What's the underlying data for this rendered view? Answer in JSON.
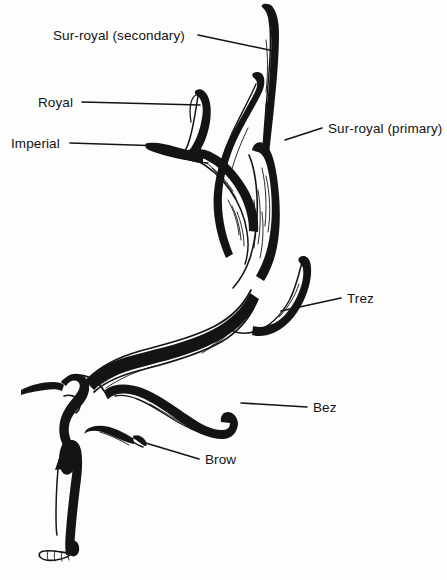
{
  "figure": {
    "background_color": "#fdfdfd",
    "ink_color": "#141414",
    "width": 447,
    "height": 580
  },
  "labels": [
    {
      "id": "sur-royal-secondary",
      "text": "Sur-royal (secondary)",
      "text_x": 53,
      "text_y": 40,
      "anchor": "start",
      "leader": "M 198 35 L 274 51",
      "side": "left"
    },
    {
      "id": "royal",
      "text": "Royal",
      "text_x": 38,
      "text_y": 107,
      "anchor": "start",
      "leader": "M 82 102 L 200 105",
      "side": "left"
    },
    {
      "id": "imperial",
      "text": "Imperial",
      "text_x": 11,
      "text_y": 148,
      "anchor": "start",
      "leader": "M 70 143 L 163 146",
      "side": "left"
    },
    {
      "id": "sur-royal-primary",
      "text": "Sur-royal (primary)",
      "text_x": 328,
      "text_y": 133,
      "anchor": "start",
      "leader": "M 322 128 L 285 140",
      "side": "right"
    },
    {
      "id": "trez",
      "text": "Trez",
      "text_x": 347,
      "text_y": 303,
      "anchor": "start",
      "leader": "M 341 298 L 281 311",
      "side": "right"
    },
    {
      "id": "bez",
      "text": "Bez",
      "text_x": 313,
      "text_y": 412,
      "anchor": "start",
      "leader": "M 307 407 L 241 403",
      "side": "right"
    },
    {
      "id": "brow",
      "text": "Brow",
      "text_x": 205,
      "text_y": 464,
      "anchor": "start",
      "leader": "M 199 459 L 139 441",
      "side": "right"
    }
  ]
}
